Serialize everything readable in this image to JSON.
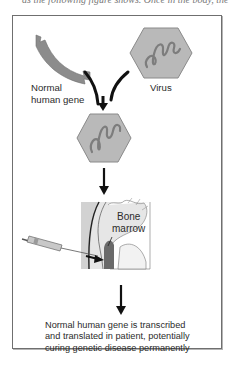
{
  "page": {
    "top_cut_text": "as the following figure shows. Once in the body, the virus d"
  },
  "diagram": {
    "labels": {
      "gene": "Normal\nhuman gene",
      "gene_line1": "Normal",
      "gene_line2": "human gene",
      "virus": "Virus",
      "bone_line1": "Bone",
      "bone_line2": "marrow",
      "result_line1": "Normal human gene is transcribed",
      "result_line2": "and translated in patient, potentially",
      "result_line3": "curing genetic disease permanently"
    },
    "colors": {
      "gene_fill": "#8c8c8c",
      "virus_fill": "#b9b9b9",
      "virus_dna": "#7d7d7d",
      "arrow": "#111111",
      "border": "#6f6f6f",
      "marrow_fill": "#6a6a6a",
      "bone_bg": "#e4e4e4"
    },
    "steps": [
      "Normal human gene + Virus",
      "Recombinant virus carrying gene",
      "Injection into bone marrow",
      "Gene expression in patient"
    ]
  }
}
